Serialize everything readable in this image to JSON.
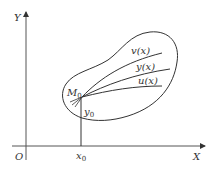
{
  "diagram": {
    "axes": {
      "x_label": "X",
      "y_label": "Y",
      "origin_label": "O"
    },
    "point": {
      "name": "M",
      "subscript": "0",
      "x_coord_label": "x",
      "x_coord_sub": "0",
      "y_coord_label": "y",
      "y_coord_sub": "0"
    },
    "curves": [
      {
        "label": "v(x)"
      },
      {
        "label": "y(x)"
      },
      {
        "label": "u(x)"
      }
    ],
    "colors": {
      "stroke": "#333333",
      "background": "#ffffff"
    }
  }
}
